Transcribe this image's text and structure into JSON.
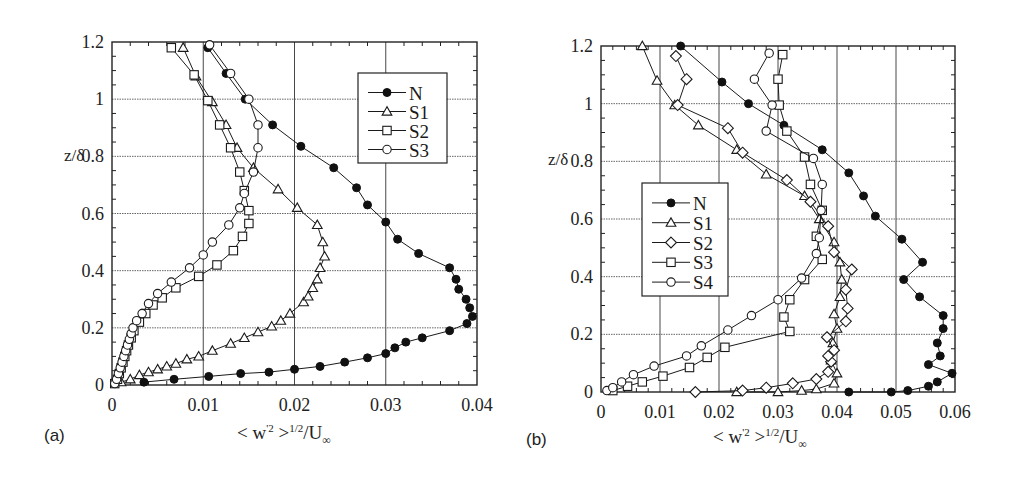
{
  "figure": {
    "panels": [
      {
        "id": "a",
        "label": "(a)"
      },
      {
        "id": "b",
        "label": "(b)"
      }
    ],
    "xlabel_text": "< w'² >^1/2/U∞",
    "xlabel_parts": {
      "pre": "< w",
      "sup1": "'2",
      "mid": " >",
      "sup2": "1/2",
      "post": "/U",
      "sub": "∞"
    },
    "ylabel": "z/δ"
  },
  "chart_data": [
    {
      "type": "line",
      "panel": "(a)",
      "title": "",
      "xlabel": "< w'^2 >^{1/2}/U∞",
      "ylabel": "z/δ",
      "xlim": [
        0,
        0.04
      ],
      "ylim": [
        0,
        1.2
      ],
      "xticks": [
        0,
        0.01,
        0.02,
        0.03,
        0.04
      ],
      "xtick_labels": [
        "0",
        "0.01",
        "0.02",
        "0.03",
        "0.04"
      ],
      "yticks": [
        0,
        0.2,
        0.4,
        0.6,
        0.8,
        1.0,
        1.2
      ],
      "ytick_labels": [
        "0",
        "0.2",
        "0.4",
        "0.6",
        "0.8",
        "1",
        "1.2"
      ],
      "grid": true,
      "legend_position": "upper right",
      "series": [
        {
          "name": "N",
          "marker": "filled-circle",
          "points": [
            [
              0.0035,
              0.01
            ],
            [
              0.0068,
              0.02
            ],
            [
              0.0106,
              0.03
            ],
            [
              0.0141,
              0.04
            ],
            [
              0.0172,
              0.045
            ],
            [
              0.02,
              0.055
            ],
            [
              0.0228,
              0.065
            ],
            [
              0.0255,
              0.08
            ],
            [
              0.028,
              0.095
            ],
            [
              0.03,
              0.11
            ],
            [
              0.031,
              0.13
            ],
            [
              0.0322,
              0.15
            ],
            [
              0.034,
              0.165
            ],
            [
              0.037,
              0.19
            ],
            [
              0.0389,
              0.215
            ],
            [
              0.0395,
              0.24
            ],
            [
              0.0392,
              0.27
            ],
            [
              0.0388,
              0.3
            ],
            [
              0.038,
              0.335
            ],
            [
              0.0377,
              0.37
            ],
            [
              0.037,
              0.41
            ],
            [
              0.0336,
              0.46
            ],
            [
              0.0313,
              0.51
            ],
            [
              0.03,
              0.57
            ],
            [
              0.028,
              0.63
            ],
            [
              0.0268,
              0.69
            ],
            [
              0.0243,
              0.76
            ],
            [
              0.0207,
              0.835
            ],
            [
              0.0176,
              0.91
            ],
            [
              0.0146,
              1.0
            ],
            [
              0.0125,
              1.09
            ],
            [
              0.0105,
              1.18
            ]
          ]
        },
        {
          "name": "S1",
          "marker": "open-triangle",
          "points": [
            [
              0.001,
              0.01
            ],
            [
              0.002,
              0.02
            ],
            [
              0.003,
              0.035
            ],
            [
              0.004,
              0.045
            ],
            [
              0.005,
              0.055
            ],
            [
              0.006,
              0.065
            ],
            [
              0.007,
              0.075
            ],
            [
              0.0082,
              0.09
            ],
            [
              0.0095,
              0.1
            ],
            [
              0.011,
              0.12
            ],
            [
              0.013,
              0.145
            ],
            [
              0.0145,
              0.165
            ],
            [
              0.016,
              0.185
            ],
            [
              0.0175,
              0.205
            ],
            [
              0.0185,
              0.225
            ],
            [
              0.0195,
              0.25
            ],
            [
              0.021,
              0.29
            ],
            [
              0.0215,
              0.31
            ],
            [
              0.022,
              0.34
            ],
            [
              0.0225,
              0.37
            ],
            [
              0.0228,
              0.41
            ],
            [
              0.0233,
              0.45
            ],
            [
              0.0231,
              0.5
            ],
            [
              0.0225,
              0.56
            ],
            [
              0.0203,
              0.62
            ],
            [
              0.0182,
              0.685
            ],
            [
              0.0155,
              0.76
            ],
            [
              0.0137,
              0.83
            ],
            [
              0.0125,
              0.91
            ],
            [
              0.011,
              0.99
            ],
            [
              0.0092,
              1.08
            ],
            [
              0.0078,
              1.18
            ]
          ]
        },
        {
          "name": "S2",
          "marker": "open-square",
          "points": [
            [
              0.0003,
              0.005
            ],
            [
              0.0006,
              0.02
            ],
            [
              0.0008,
              0.04
            ],
            [
              0.001,
              0.06
            ],
            [
              0.0012,
              0.08
            ],
            [
              0.0014,
              0.1
            ],
            [
              0.0016,
              0.12
            ],
            [
              0.0018,
              0.14
            ],
            [
              0.0021,
              0.165
            ],
            [
              0.0024,
              0.19
            ],
            [
              0.003,
              0.22
            ],
            [
              0.0037,
              0.25
            ],
            [
              0.0045,
              0.28
            ],
            [
              0.0055,
              0.305
            ],
            [
              0.007,
              0.34
            ],
            [
              0.0095,
              0.38
            ],
            [
              0.0115,
              0.42
            ],
            [
              0.0133,
              0.47
            ],
            [
              0.0143,
              0.52
            ],
            [
              0.015,
              0.565
            ],
            [
              0.015,
              0.61
            ],
            [
              0.0145,
              0.68
            ],
            [
              0.014,
              0.745
            ],
            [
              0.013,
              0.83
            ],
            [
              0.0118,
              0.91
            ],
            [
              0.0105,
              0.995
            ],
            [
              0.009,
              1.085
            ],
            [
              0.0065,
              1.18
            ]
          ]
        },
        {
          "name": "S3",
          "marker": "open-circle",
          "points": [
            [
              0.0003,
              0.005
            ],
            [
              0.0005,
              0.02
            ],
            [
              0.0007,
              0.04
            ],
            [
              0.0009,
              0.06
            ],
            [
              0.0011,
              0.08
            ],
            [
              0.0013,
              0.1
            ],
            [
              0.0015,
              0.12
            ],
            [
              0.0017,
              0.14
            ],
            [
              0.0019,
              0.16
            ],
            [
              0.0021,
              0.18
            ],
            [
              0.0023,
              0.2
            ],
            [
              0.0027,
              0.225
            ],
            [
              0.0033,
              0.25
            ],
            [
              0.004,
              0.285
            ],
            [
              0.005,
              0.32
            ],
            [
              0.0065,
              0.36
            ],
            [
              0.0085,
              0.41
            ],
            [
              0.01,
              0.455
            ],
            [
              0.011,
              0.5
            ],
            [
              0.0128,
              0.56
            ],
            [
              0.014,
              0.62
            ],
            [
              0.0145,
              0.67
            ],
            [
              0.0155,
              0.745
            ],
            [
              0.016,
              0.83
            ],
            [
              0.016,
              0.91
            ],
            [
              0.015,
              1.0
            ],
            [
              0.013,
              1.09
            ],
            [
              0.0107,
              1.19
            ]
          ]
        }
      ]
    },
    {
      "type": "line",
      "panel": "(b)",
      "title": "",
      "xlabel": "< w'^2 >^{1/2}/U∞",
      "ylabel": "z/δ",
      "xlim": [
        0,
        0.06
      ],
      "ylim": [
        0,
        1.2
      ],
      "xticks": [
        0,
        0.01,
        0.02,
        0.03,
        0.04,
        0.05,
        0.06
      ],
      "xtick_labels": [
        "0",
        "0.01",
        "0.02",
        "0.03",
        "0.04",
        "0.05",
        "0.06"
      ],
      "yticks": [
        0,
        0.2,
        0.4,
        0.6,
        0.8,
        1.0,
        1.2
      ],
      "ytick_labels": [
        "0",
        "0.2",
        "0.4",
        "0.6",
        "0.8",
        "1",
        "1.2"
      ],
      "grid": true,
      "legend_position": "center left",
      "series": [
        {
          "name": "N",
          "marker": "filled-circle",
          "points": [
            [
              0.042,
              0.0
            ],
            [
              0.0492,
              0.0
            ],
            [
              0.052,
              0.005
            ],
            [
              0.0555,
              0.02
            ],
            [
              0.057,
              0.035
            ],
            [
              0.0595,
              0.065
            ],
            [
              0.0555,
              0.095
            ],
            [
              0.0575,
              0.125
            ],
            [
              0.057,
              0.17
            ],
            [
              0.058,
              0.22
            ],
            [
              0.058,
              0.265
            ],
            [
              0.054,
              0.33
            ],
            [
              0.0513,
              0.39
            ],
            [
              0.0545,
              0.45
            ],
            [
              0.051,
              0.53
            ],
            [
              0.0465,
              0.61
            ],
            [
              0.0445,
              0.68
            ],
            [
              0.042,
              0.76
            ],
            [
              0.0375,
              0.84
            ],
            [
              0.031,
              0.925
            ],
            [
              0.025,
              1.0
            ],
            [
              0.0205,
              1.075
            ],
            [
              0.0135,
              1.2
            ]
          ]
        },
        {
          "name": "S1",
          "marker": "open-triangle",
          "points": [
            [
              0.023,
              0.0
            ],
            [
              0.03,
              0.0
            ],
            [
              0.034,
              0.005
            ],
            [
              0.0365,
              0.01
            ],
            [
              0.0395,
              0.03
            ],
            [
              0.04,
              0.065
            ],
            [
              0.039,
              0.11
            ],
            [
              0.0393,
              0.17
            ],
            [
              0.04,
              0.22
            ],
            [
              0.0395,
              0.27
            ],
            [
              0.0405,
              0.33
            ],
            [
              0.0408,
              0.39
            ],
            [
              0.0405,
              0.45
            ],
            [
              0.0395,
              0.52
            ],
            [
              0.037,
              0.6
            ],
            [
              0.0345,
              0.68
            ],
            [
              0.028,
              0.755
            ],
            [
              0.023,
              0.84
            ],
            [
              0.0165,
              0.925
            ],
            [
              0.0125,
              0.995
            ],
            [
              0.0095,
              1.08
            ],
            [
              0.007,
              1.2
            ]
          ]
        },
        {
          "name": "S2",
          "marker": "open-diamond",
          "points": [
            [
              0.016,
              0.0
            ],
            [
              0.024,
              0.005
            ],
            [
              0.028,
              0.015
            ],
            [
              0.0325,
              0.03
            ],
            [
              0.0365,
              0.045
            ],
            [
              0.0385,
              0.07
            ],
            [
              0.039,
              0.105
            ],
            [
              0.0385,
              0.125
            ],
            [
              0.0395,
              0.145
            ],
            [
              0.0383,
              0.19
            ],
            [
              0.0415,
              0.245
            ],
            [
              0.0418,
              0.29
            ],
            [
              0.0415,
              0.355
            ],
            [
              0.0425,
              0.425
            ],
            [
              0.0395,
              0.485
            ],
            [
              0.0385,
              0.575
            ],
            [
              0.0355,
              0.66
            ],
            [
              0.0315,
              0.735
            ],
            [
              0.024,
              0.83
            ],
            [
              0.0215,
              0.915
            ],
            [
              0.013,
              0.995
            ],
            [
              0.0145,
              1.085
            ],
            [
              0.0127,
              1.165
            ]
          ]
        },
        {
          "name": "S3",
          "marker": "open-square",
          "points": [
            [
              0.002,
              0.005
            ],
            [
              0.0045,
              0.02
            ],
            [
              0.007,
              0.035
            ],
            [
              0.0105,
              0.055
            ],
            [
              0.015,
              0.085
            ],
            [
              0.018,
              0.12
            ],
            [
              0.021,
              0.155
            ],
            [
              0.032,
              0.21
            ],
            [
              0.031,
              0.26
            ],
            [
              0.032,
              0.32
            ],
            [
              0.0345,
              0.39
            ],
            [
              0.0375,
              0.46
            ],
            [
              0.0365,
              0.54
            ],
            [
              0.0375,
              0.63
            ],
            [
              0.0355,
              0.72
            ],
            [
              0.0345,
              0.815
            ],
            [
              0.0315,
              0.905
            ],
            [
              0.0302,
              0.995
            ],
            [
              0.03,
              1.085
            ],
            [
              0.0308,
              1.17
            ]
          ]
        },
        {
          "name": "S4",
          "marker": "open-circle",
          "points": [
            [
              0.001,
              0.005
            ],
            [
              0.002,
              0.015
            ],
            [
              0.0035,
              0.035
            ],
            [
              0.0055,
              0.06
            ],
            [
              0.009,
              0.09
            ],
            [
              0.0145,
              0.125
            ],
            [
              0.017,
              0.16
            ],
            [
              0.0215,
              0.215
            ],
            [
              0.0255,
              0.265
            ],
            [
              0.03,
              0.32
            ],
            [
              0.034,
              0.395
            ],
            [
              0.0365,
              0.48
            ],
            [
              0.037,
              0.535
            ],
            [
              0.0373,
              0.63
            ],
            [
              0.0375,
              0.72
            ],
            [
              0.036,
              0.81
            ],
            [
              0.028,
              0.905
            ],
            [
              0.029,
              0.995
            ],
            [
              0.026,
              1.085
            ],
            [
              0.0285,
              1.175
            ]
          ]
        }
      ]
    }
  ]
}
